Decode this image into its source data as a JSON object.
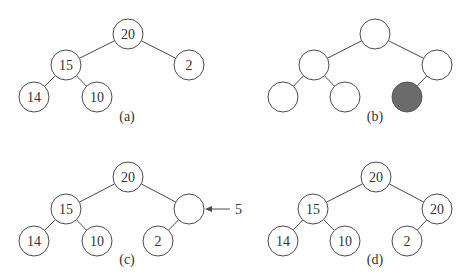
{
  "figure": {
    "radius": 15,
    "colors": {
      "stroke": "#4a4a4a",
      "fill": "#ffffff",
      "highlight": "#6b6b6b",
      "text": "#333333"
    }
  },
  "panels": [
    {
      "id": "a",
      "caption": "(a)",
      "caption_pos": [
        127,
        121
      ],
      "nodes": [
        {
          "id": "root",
          "value": "20",
          "x": 128,
          "y": 34
        },
        {
          "id": "l",
          "value": "15",
          "x": 66,
          "y": 65
        },
        {
          "id": "r",
          "value": "2",
          "x": 189,
          "y": 65
        },
        {
          "id": "ll",
          "value": "14",
          "x": 34,
          "y": 97
        },
        {
          "id": "lr",
          "value": "10",
          "x": 97,
          "y": 97
        }
      ],
      "edges": [
        [
          "root",
          "l"
        ],
        [
          "root",
          "r"
        ],
        [
          "l",
          "ll"
        ],
        [
          "l",
          "lr"
        ]
      ]
    },
    {
      "id": "b",
      "caption": "(b)",
      "caption_pos": [
        375,
        121
      ],
      "nodes": [
        {
          "id": "root",
          "value": "",
          "x": 375,
          "y": 34
        },
        {
          "id": "l",
          "value": "",
          "x": 314,
          "y": 65
        },
        {
          "id": "r",
          "value": "",
          "x": 437,
          "y": 65
        },
        {
          "id": "ll",
          "value": "",
          "x": 283,
          "y": 97
        },
        {
          "id": "lr",
          "value": "",
          "x": 345,
          "y": 97
        },
        {
          "id": "rl",
          "value": "",
          "x": 407,
          "y": 97,
          "highlight": true
        }
      ],
      "edges": [
        [
          "root",
          "l"
        ],
        [
          "root",
          "r"
        ],
        [
          "l",
          "ll"
        ],
        [
          "l",
          "lr"
        ],
        [
          "r",
          "rl"
        ]
      ]
    },
    {
      "id": "c",
      "caption": "(c)",
      "caption_pos": [
        127,
        264
      ],
      "nodes": [
        {
          "id": "root",
          "value": "20",
          "x": 128,
          "y": 177
        },
        {
          "id": "l",
          "value": "15",
          "x": 66,
          "y": 209
        },
        {
          "id": "r",
          "value": "",
          "x": 189,
          "y": 209
        },
        {
          "id": "ll",
          "value": "14",
          "x": 34,
          "y": 241
        },
        {
          "id": "lr",
          "value": "10",
          "x": 97,
          "y": 241
        },
        {
          "id": "rl",
          "value": "2",
          "x": 158,
          "y": 241
        }
      ],
      "edges": [
        [
          "root",
          "l"
        ],
        [
          "root",
          "r"
        ],
        [
          "l",
          "ll"
        ],
        [
          "l",
          "lr"
        ],
        [
          "r",
          "rl"
        ]
      ],
      "arrow": {
        "label": "5",
        "from": [
          230,
          209
        ],
        "to": [
          205,
          209
        ],
        "label_pos": [
          235,
          214
        ]
      }
    },
    {
      "id": "d",
      "caption": "(d)",
      "caption_pos": [
        375,
        264
      ],
      "nodes": [
        {
          "id": "root",
          "value": "20",
          "x": 376,
          "y": 177
        },
        {
          "id": "l",
          "value": "15",
          "x": 313,
          "y": 209
        },
        {
          "id": "r",
          "value": "20",
          "x": 437,
          "y": 209
        },
        {
          "id": "ll",
          "value": "14",
          "x": 283,
          "y": 241
        },
        {
          "id": "lr",
          "value": "10",
          "x": 345,
          "y": 241
        },
        {
          "id": "rl",
          "value": "2",
          "x": 407,
          "y": 241
        }
      ],
      "edges": [
        [
          "root",
          "l"
        ],
        [
          "root",
          "r"
        ],
        [
          "l",
          "ll"
        ],
        [
          "l",
          "lr"
        ],
        [
          "r",
          "rl"
        ]
      ]
    }
  ]
}
